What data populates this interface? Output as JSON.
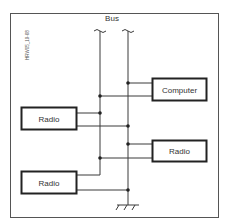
{
  "figure_id": "HRW05_19-68",
  "bus": {
    "label": "Bus"
  },
  "devices": [
    {
      "id": "computer",
      "label": "Computer"
    },
    {
      "id": "radio-top-left",
      "label": "Radio"
    },
    {
      "id": "radio-right",
      "label": "Radio"
    },
    {
      "id": "radio-bottom-left",
      "label": "Radio"
    }
  ],
  "colors": {
    "line": "#3a3a3a",
    "frame": "#555555",
    "box": "#222222",
    "text": "#333333"
  }
}
